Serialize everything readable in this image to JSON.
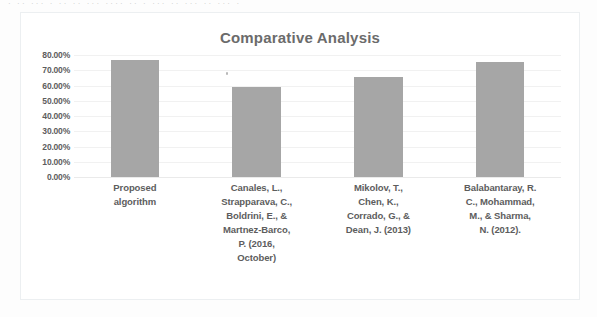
{
  "page": {
    "top_fragment_text": "· ·· ··· · ·· ·· ··· ···· ·· · ··· ·· ··· ·· ··· ·"
  },
  "colors": {
    "bar": "#a6a6a6",
    "title_text": "#6b6b6b",
    "axis_text": "#5d5d5d",
    "gridline": "#f1f1f1",
    "frame_border": "#eceff1",
    "background": "#ffffff"
  },
  "chart_data": {
    "type": "bar",
    "title": "Comparative Analysis",
    "xlabel": "",
    "ylabel": "",
    "ylim": [
      0,
      0.8
    ],
    "grid": true,
    "legend": false,
    "legend_position": "none",
    "categories": [
      "Proposed algorithm",
      "Canales, L., Strapparava, C., Boldrini, E., & Martnez-Barco, P. (2016, October)",
      "Mikolov, T., Chen, K., Corrado, G., & Dean, J. (2013)",
      "Balabantaray, R. C., Mohammad, M., & Sharma, N. (2012)."
    ],
    "category_lines": [
      [
        "Proposed",
        "algorithm"
      ],
      [
        "Canales, L.,",
        "Strapparava, C.,",
        "Boldrini, E., &",
        "Martnez-Barco,",
        "P. (2016,",
        "October)"
      ],
      [
        "Mikolov, T.,",
        "Chen, K.,",
        "Corrado, G., &",
        "Dean, J. (2013)"
      ],
      [
        "Balabantaray, R.",
        "C., Mohammad,",
        "M., & Sharma,",
        "N. (2012)."
      ]
    ],
    "values": [
      0.77,
      0.59,
      0.655,
      0.755
    ],
    "value_labels": [
      "77.00%",
      "59.00%",
      "65.50%",
      "75.50%"
    ],
    "ytick_values": [
      0.8,
      0.7,
      0.6,
      0.5,
      0.4,
      0.3,
      0.2,
      0.1,
      0.0
    ],
    "ytick_labels": [
      "80.00%",
      "70.00%",
      "60.00%",
      "50.00%",
      "40.00%",
      "30.00%",
      "20.00%",
      "10.00%",
      "0.00%"
    ]
  }
}
